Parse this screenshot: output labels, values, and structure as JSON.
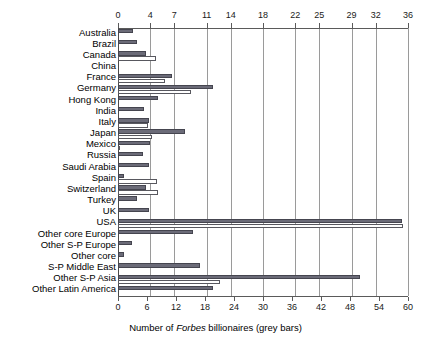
{
  "chart_data": {
    "type": "bar",
    "orientation": "horizontal",
    "title": "",
    "xlabel": "Number of Forbes billionaires (grey bars)",
    "ylabel": "",
    "grid": true,
    "legend_position": "none",
    "categories": [
      "Australia",
      "Brazil",
      "Canada",
      "China",
      "France",
      "Germany",
      "Hong Kong",
      "India",
      "Italy",
      "Japan",
      "Mexico",
      "Russia",
      "Saudi Arabia",
      "Spain",
      "Switzerland",
      "Turkey",
      "UK",
      "USA",
      "Other core Europe",
      "Other S-P Europe",
      "Other core",
      "S-P Middle East",
      "Other S-P Asia",
      "Other Latin America"
    ],
    "top_axis": {
      "label": "Number of Forbes billionaires (grey bars)",
      "ticks": [
        0,
        4,
        7,
        11,
        14,
        18,
        22,
        25,
        29,
        32,
        36
      ],
      "min": 0,
      "max": 36
    },
    "bottom_axis": {
      "ticks": [
        0,
        6,
        12,
        18,
        24,
        30,
        36,
        42,
        48,
        54,
        60
      ],
      "min": 0,
      "max": 60
    },
    "series": [
      {
        "name": "Forbes billionaires (grey bars)",
        "color": "#6b6b78",
        "style": "grey",
        "axis": "top",
        "values": [
          1.8,
          2.4,
          3.5,
          0.0,
          6.7,
          11.8,
          5.0,
          3.2,
          3.8,
          8.3,
          4.0,
          3.1,
          3.9,
          0.7,
          3.5,
          2.3,
          3.9,
          35.2,
          9.3,
          1.7,
          0.8,
          10.2,
          30.0,
          11.8
        ]
      },
      {
        "name": "Second measure (white bars)",
        "color": "#ffffff",
        "style": "white",
        "axis": "bottom",
        "values": [
          0.0,
          0.0,
          7.9,
          0.0,
          9.8,
          15.0,
          0.0,
          0.0,
          6.2,
          7.0,
          0.5,
          0.0,
          0.0,
          8.1,
          8.3,
          0.0,
          0.0,
          59.0,
          0.0,
          0.0,
          0.0,
          0.0,
          21.0,
          0.0
        ]
      }
    ]
  },
  "footer": {
    "prefix": "Number of ",
    "italic": "Forbes",
    "suffix": " billionaires (grey bars)"
  }
}
